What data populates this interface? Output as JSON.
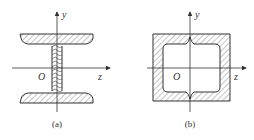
{
  "figure": {
    "panels": [
      {
        "id": "a",
        "shape": "I-section (wide flange beam) cross-section with hatched material",
        "caption": "(a)",
        "axes": {
          "vertical": "y",
          "horizontal": "z",
          "origin": "O"
        }
      },
      {
        "id": "b",
        "shape": "Hollow square box-section cross-section with hatched walls",
        "caption": "(b)",
        "axes": {
          "vertical": "y",
          "horizontal": "z",
          "origin": "O"
        }
      }
    ],
    "colors": {
      "stroke": "#333333",
      "hatch": "#555555",
      "background": "#ffffff"
    }
  }
}
